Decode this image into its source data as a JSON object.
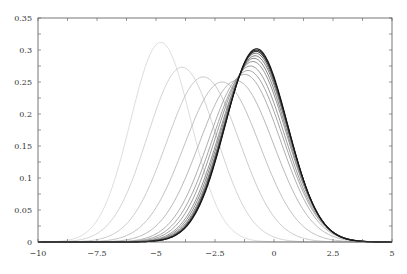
{
  "chart_data": {
    "type": "line",
    "title": "",
    "xlabel": "",
    "ylabel": "",
    "xlim": [
      -10,
      5
    ],
    "ylim": [
      0,
      0.35
    ],
    "grid": false,
    "legend": null,
    "x_ticks": [
      -10,
      -7.5,
      -5,
      -2.5,
      0,
      2.5,
      5
    ],
    "x_tick_labels": [
      "−10",
      "−7.5",
      "−5",
      "−2.5",
      "0",
      "2.5",
      "5"
    ],
    "x_minor_step": 1.25,
    "y_ticks": [
      0,
      0.05,
      0.1,
      0.15,
      0.2,
      0.25,
      0.3,
      0.35
    ],
    "y_tick_labels": [
      "0",
      "0.05",
      "0.1",
      "0.15",
      "0.2",
      "0.25",
      "0.3",
      "0.35"
    ],
    "y_minor_step": 0.025,
    "curve_shape": "gaussian density",
    "series": [
      {
        "name": "curve-1",
        "mean": -4.8,
        "peak": 0.312,
        "color": "#d4d4d4"
      },
      {
        "name": "curve-2",
        "mean": -3.9,
        "peak": 0.273,
        "color": "#c8c8c8"
      },
      {
        "name": "curve-3",
        "mean": -3.0,
        "peak": 0.258,
        "color": "#bcbcbc"
      },
      {
        "name": "curve-4",
        "mean": -2.2,
        "peak": 0.25,
        "color": "#b0b0b0"
      },
      {
        "name": "curve-5",
        "mean": -1.6,
        "peak": 0.252,
        "color": "#a4a4a4"
      },
      {
        "name": "curve-6",
        "mean": -1.25,
        "peak": 0.262,
        "color": "#989898"
      },
      {
        "name": "curve-7",
        "mean": -1.1,
        "peak": 0.268,
        "color": "#8c8c8c"
      },
      {
        "name": "curve-8",
        "mean": -1.0,
        "peak": 0.275,
        "color": "#808080"
      },
      {
        "name": "curve-9",
        "mean": -0.9,
        "peak": 0.282,
        "color": "#737373"
      },
      {
        "name": "curve-10",
        "mean": -0.85,
        "peak": 0.287,
        "color": "#666666"
      },
      {
        "name": "curve-11",
        "mean": -0.8,
        "peak": 0.291,
        "color": "#585858"
      },
      {
        "name": "curve-12",
        "mean": -0.78,
        "peak": 0.295,
        "color": "#4a4a4a"
      },
      {
        "name": "curve-13",
        "mean": -0.76,
        "peak": 0.298,
        "color": "#3a3a3a"
      },
      {
        "name": "curve-14",
        "mean": -0.75,
        "peak": 0.3,
        "color": "#2a2a2a"
      },
      {
        "name": "curve-15",
        "mean": -0.74,
        "peak": 0.302,
        "color": "#151515"
      }
    ]
  },
  "layout": {
    "plot_left": 38,
    "plot_right": 392,
    "plot_top": 18,
    "plot_bottom": 242
  }
}
